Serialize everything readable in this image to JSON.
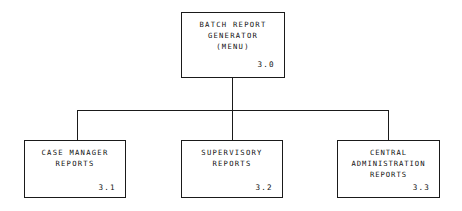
{
  "diagram": {
    "type": "hierarchy-decomposition-chart",
    "line_color": "#1a1a1a",
    "text_color": "#121212",
    "background_color": "#ffffff",
    "root": {
      "name": "batch-report-generator",
      "lines": [
        "BATCH REPORT",
        "GENERATOR",
        "(MENU)"
      ],
      "line1": "BATCH REPORT",
      "line2": "GENERATOR",
      "line3": "(MENU)",
      "id": "3.0"
    },
    "children": [
      {
        "name": "case-manager-reports",
        "lines": [
          "CASE MANAGER",
          "REPORTS"
        ],
        "line1": "CASE MANAGER",
        "line2": "REPORTS",
        "line3": "",
        "id": "3.1"
      },
      {
        "name": "supervisory-reports",
        "lines": [
          "SUPERVISORY",
          "REPORTS"
        ],
        "line1": "SUPERVISORY",
        "line2": "REPORTS",
        "line3": "",
        "id": "3.2"
      },
      {
        "name": "central-administration-reports",
        "lines": [
          "CENTRAL",
          "ADMINISTRATION",
          "REPORTS"
        ],
        "line1": "CENTRAL",
        "line2": "ADMINISTRATION",
        "line3": "REPORTS",
        "id": "3.3"
      }
    ]
  }
}
